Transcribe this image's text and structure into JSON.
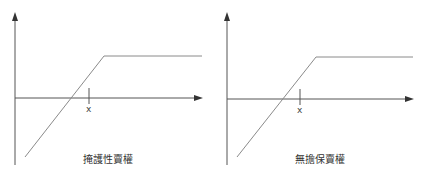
{
  "colors": {
    "axis": "#555555",
    "line": "#8a8a8a",
    "text": "#333333"
  },
  "panels": [
    {
      "caption": "掩護性賣權",
      "strike_label": "x",
      "payoff_shape": "rising diagonal then flat",
      "kink_x": 104,
      "kink_y": 56,
      "diag_start": [
        25,
        157
      ],
      "flat_end_x": 202,
      "strike_x": 89
    },
    {
      "caption": "無擔保賣權",
      "strike_label": "x",
      "payoff_shape": "rising diagonal then flat",
      "kink_x": 104,
      "kink_y": 56,
      "diag_start": [
        26,
        157
      ],
      "flat_end_x": 202,
      "strike_x": 89
    }
  ]
}
